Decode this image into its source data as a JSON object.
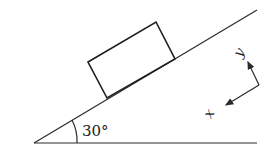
{
  "diagram": {
    "angle_label": "30°",
    "axis_x_label": "x",
    "axis_y_label": "y",
    "elements": [
      "incline",
      "ground",
      "block",
      "angle-arc",
      "coordinate-axes"
    ]
  }
}
